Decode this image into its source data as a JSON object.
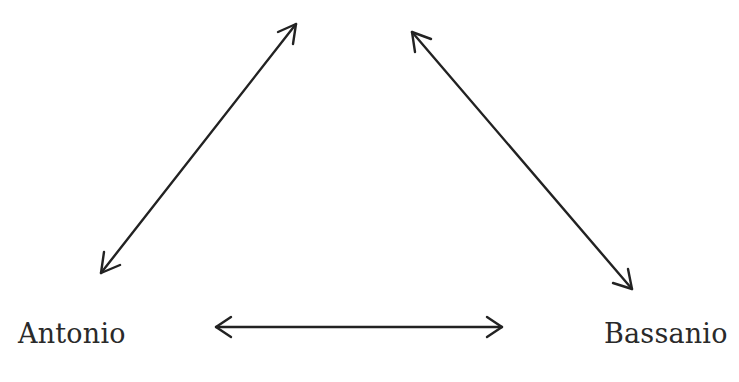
{
  "diagram": {
    "type": "relationship-triangle",
    "nodes": [
      {
        "id": "antonio",
        "label": "Antonio"
      },
      {
        "id": "bassanio",
        "label": "Bassanio"
      }
    ],
    "edges": [
      {
        "from": "antonio",
        "to": "top",
        "style": "double-arrow"
      },
      {
        "from": "bassanio",
        "to": "top",
        "style": "double-arrow"
      },
      {
        "from": "antonio",
        "to": "bassanio",
        "style": "double-arrow"
      }
    ],
    "stroke_color": "#222222"
  }
}
